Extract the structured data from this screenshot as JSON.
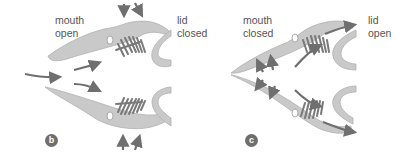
{
  "panels": [
    {
      "id": "b",
      "badge": "b",
      "mouth_label_line1": "mouth",
      "mouth_label_line2": "open",
      "lid_label_line1": "lid",
      "lid_label_line2": "closed"
    },
    {
      "id": "c",
      "badge": "c",
      "mouth_label_line1": "mouth",
      "mouth_label_line2": "closed",
      "lid_label_line1": "lid",
      "lid_label_line2": "open"
    }
  ],
  "colors": {
    "jaw_fill": "#c9c9c9",
    "jaw_stroke": "#a9a9a9",
    "arrow": "#6f6f6f",
    "gill": "#7a7a7a",
    "label": "#555555",
    "badge_bg": "#6e6e6e"
  }
}
